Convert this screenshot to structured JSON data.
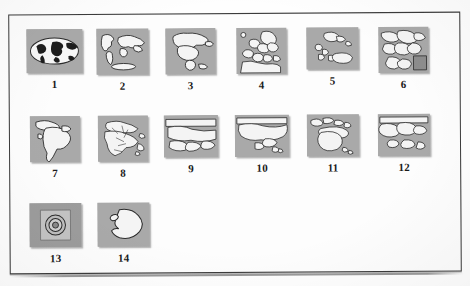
{
  "figure": {
    "kind": "scanned-figure-plate",
    "caption": "",
    "frame_color": "#3c3c3c",
    "thumb_background": "#a9a9a9",
    "landmass_color": "#f4f4f4",
    "outline_color": "#2b2b2b",
    "thumbnail_count": 14,
    "rows": 3,
    "columns": 6
  },
  "thumbnails": [
    {
      "number": "1",
      "name": "world-map",
      "icon": "world-oval-icon",
      "width": 56,
      "height": 44
    },
    {
      "number": "2",
      "name": "world-continents",
      "icon": "world-flat-icon",
      "width": 52,
      "height": 46
    },
    {
      "number": "3",
      "name": "north-america",
      "icon": "north-america-icon",
      "width": 50,
      "height": 46
    },
    {
      "number": "4",
      "name": "europe",
      "icon": "europe-icon",
      "width": 50,
      "height": 46
    },
    {
      "number": "5",
      "name": "caribbean",
      "icon": "caribbean-icon",
      "width": 52,
      "height": 42
    },
    {
      "number": "6",
      "name": "middle-east",
      "icon": "middle-east-icon",
      "width": 50,
      "height": 46
    },
    {
      "number": "7",
      "name": "south-america",
      "icon": "south-america-icon",
      "width": 50,
      "height": 46
    },
    {
      "number": "8",
      "name": "africa",
      "icon": "africa-icon",
      "width": 50,
      "height": 46
    },
    {
      "number": "9",
      "name": "eurasia-region",
      "icon": "eurasia-icon",
      "width": 54,
      "height": 42
    },
    {
      "number": "10",
      "name": "asia",
      "icon": "asia-icon",
      "width": 54,
      "height": 42
    },
    {
      "number": "11",
      "name": "oceania-australia",
      "icon": "australia-icon",
      "width": 52,
      "height": 42
    },
    {
      "number": "12",
      "name": "southeast-asia",
      "icon": "southeast-asia-icon",
      "width": 52,
      "height": 42
    },
    {
      "number": "13",
      "name": "polar-arctic",
      "icon": "polar-circles-icon",
      "width": 52,
      "height": 44
    },
    {
      "number": "14",
      "name": "antarctica",
      "icon": "antarctica-icon",
      "width": 52,
      "height": 44
    }
  ]
}
